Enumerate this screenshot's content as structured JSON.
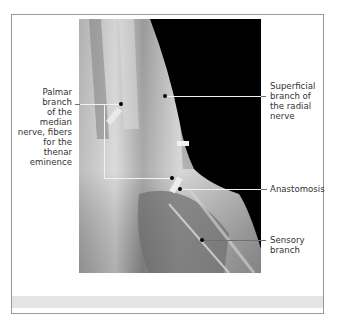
{
  "figure": {
    "labels": {
      "palmar": [
        "Palmar branch",
        "of the median",
        "nerve, fibers",
        "for the thenar",
        "eminence"
      ],
      "superficial": [
        "Superficial",
        "branch of",
        "the radial",
        "nerve"
      ],
      "anastomosis": [
        "Anastomosis"
      ],
      "sensory": [
        "Sensory",
        "branch"
      ]
    },
    "colors": {
      "frame_border": "#9a9a9a",
      "caption_band": "#e4e4e4",
      "background_black": "#000000",
      "text": "#333333"
    }
  }
}
